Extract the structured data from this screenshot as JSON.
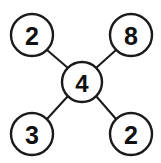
{
  "diagram": {
    "type": "node-link-graph",
    "background_color": "#ffffff",
    "stroke_color": "#1a1a1a",
    "text_color": "#111111",
    "nodes": [
      {
        "id": "top-left",
        "label": "2",
        "cx": 32,
        "cy": 35,
        "r": 21
      },
      {
        "id": "top-right",
        "label": "8",
        "cx": 131,
        "cy": 35,
        "r": 21
      },
      {
        "id": "center",
        "label": "4",
        "cx": 82,
        "cy": 82,
        "r": 20
      },
      {
        "id": "bottom-left",
        "label": "3",
        "cx": 32,
        "cy": 134,
        "r": 21
      },
      {
        "id": "bottom-right",
        "label": "2",
        "cx": 131,
        "cy": 134,
        "r": 21
      }
    ],
    "edges": [
      {
        "id": "edge-center-top-left",
        "from": "center",
        "to": "top-left",
        "x1": 68,
        "y1": 68,
        "x2": 47,
        "y2": 50
      },
      {
        "id": "edge-center-top-right",
        "from": "center",
        "to": "top-right",
        "x1": 96,
        "y1": 68,
        "x2": 116,
        "y2": 50
      },
      {
        "id": "edge-center-bottom-left",
        "from": "center",
        "to": "bottom-left",
        "x1": 68,
        "y1": 96,
        "x2": 47,
        "y2": 119
      },
      {
        "id": "edge-center-bottom-right",
        "from": "center",
        "to": "bottom-right",
        "x1": 96,
        "y1": 96,
        "x2": 116,
        "y2": 119
      }
    ]
  }
}
